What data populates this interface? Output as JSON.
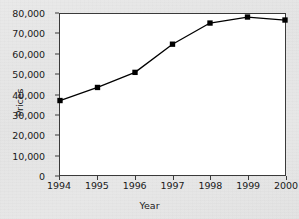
{
  "chart_data": {
    "type": "line",
    "title": "",
    "xlabel": "Year",
    "ylabel": "Prices",
    "categories": [
      "1994",
      "1995",
      "1996",
      "1997",
      "1998",
      "1999",
      "2000"
    ],
    "values": [
      37000,
      43500,
      51000,
      65000,
      75500,
      78500,
      77000
    ],
    "series": [
      {
        "name": "Prices",
        "values": [
          37000,
          43500,
          51000,
          65000,
          75500,
          78500,
          77000
        ]
      }
    ],
    "x": [
      1994,
      1995,
      1996,
      1997,
      1998,
      1999,
      2000
    ],
    "ylim": [
      0,
      80000
    ],
    "xlim": [
      1994,
      2000
    ],
    "yticks": [
      0,
      10000,
      20000,
      30000,
      40000,
      50000,
      60000,
      70000,
      80000
    ],
    "ytick_labels": [
      "0",
      "10,000",
      "20,000",
      "30,000",
      "40,000",
      "50,000",
      "60,000",
      "70,000",
      "80,000"
    ],
    "xtick_labels": [
      "1994",
      "1995",
      "1996",
      "1997",
      "1998",
      "1999",
      "2000"
    ],
    "grid": false,
    "legend": false,
    "legend_position": "none",
    "marker": "square",
    "line_color": "#000000",
    "marker_color": "#000000",
    "plot_background": "#ffffff",
    "figure_background": "#e6e6e6",
    "axis_color": "#3a3a3a"
  }
}
